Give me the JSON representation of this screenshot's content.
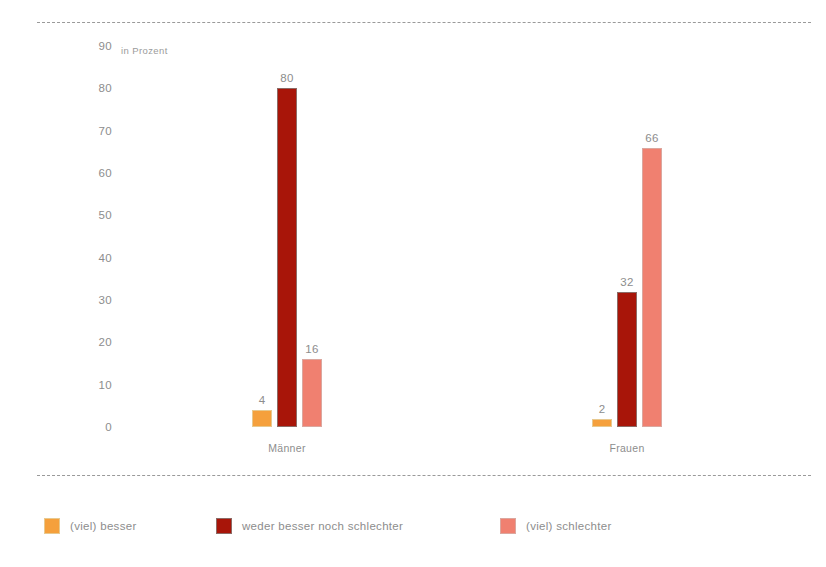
{
  "chart_data": {
    "type": "bar",
    "title": "",
    "subtitle": "",
    "unit_label": "in Prozent",
    "xlabel": "",
    "ylabel": "",
    "ylim": [
      0,
      90
    ],
    "yticks": [
      90,
      80,
      70,
      60,
      50,
      40,
      30,
      20,
      10,
      0
    ],
    "ytick_labels": [
      "90",
      "80",
      "70",
      "60",
      "50",
      "40",
      "30",
      "20",
      "10",
      "0"
    ],
    "grid": false,
    "legend_position": "bottom",
    "categories": [
      "Männer",
      "Frauen"
    ],
    "series": [
      {
        "name": "(viel) besser",
        "color": "#f5a03c",
        "values": [
          4,
          2
        ],
        "value_labels": [
          "4",
          "2"
        ]
      },
      {
        "name": "weder besser noch schlechter",
        "color": "#a81509",
        "values": [
          80,
          32
        ],
        "value_labels": [
          "80",
          "32"
        ]
      },
      {
        "name": "(viel) schlechter",
        "color": "#f08070",
        "values": [
          16,
          66
        ],
        "value_labels": [
          "16",
          "66"
        ]
      }
    ]
  },
  "colors": {
    "besser": "#f5a03c",
    "neutral": "#a81509",
    "schlechter": "#f08070",
    "text": "#8d8d8d",
    "rule": "#9a9a9a",
    "background": "#ffffff"
  }
}
